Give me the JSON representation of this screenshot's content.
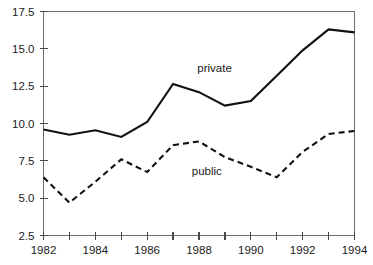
{
  "chart_data": {
    "type": "line",
    "title": "",
    "subtitle": "",
    "xlabel": "",
    "ylabel": "",
    "x": [
      1982,
      1983,
      1984,
      1985,
      1986,
      1987,
      1988,
      1989,
      1990,
      1991,
      1992,
      1993,
      1994
    ],
    "xlim": [
      1982,
      1994
    ],
    "ylim": [
      2.5,
      17.5
    ],
    "grid": false,
    "legend_position": "inline-annotation",
    "x_tick_values": [
      1982,
      1983,
      1984,
      1985,
      1986,
      1987,
      1988,
      1989,
      1990,
      1991,
      1992,
      1993,
      1994
    ],
    "x_tick_labels": [
      "1982",
      "",
      "1984",
      "",
      "1986",
      "",
      "1988",
      "",
      "1990",
      "",
      "1992",
      "",
      "1994"
    ],
    "y_tick_values": [
      2.5,
      5.0,
      7.5,
      10.0,
      12.5,
      15.0,
      17.5
    ],
    "y_tick_labels": [
      "2.5",
      "5.0",
      "7.5",
      "10.0",
      "12.5",
      "15.0",
      "17.5"
    ],
    "series": [
      {
        "name": "private",
        "label": "private",
        "style": "solid",
        "color": "#111111",
        "annotation_x": 1988.6,
        "annotation_y": 13.45,
        "values": [
          9.6,
          9.25,
          9.55,
          9.1,
          10.1,
          12.65,
          12.1,
          11.2,
          11.5,
          13.2,
          14.9,
          16.3,
          16.1
        ]
      },
      {
        "name": "public",
        "label": "public",
        "style": "dashed",
        "color": "#111111",
        "annotation_x": 1988.3,
        "annotation_y": 6.55,
        "values": [
          6.4,
          4.7,
          6.1,
          7.6,
          6.75,
          8.55,
          8.8,
          7.75,
          7.1,
          6.4,
          8.1,
          9.3,
          9.5
        ]
      }
    ]
  }
}
